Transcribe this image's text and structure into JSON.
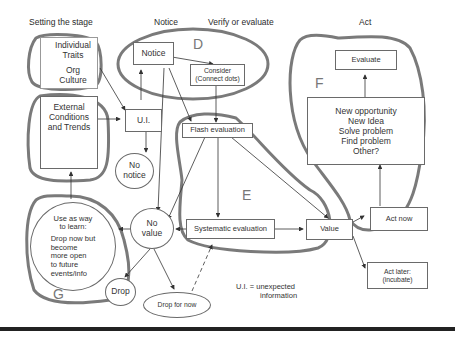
{
  "headers": {
    "setting_stage": "Setting the stage",
    "notice": "Notice",
    "verify": "Verify or evaluate",
    "act": "Act"
  },
  "region_labels": {
    "A": "A",
    "B": "B",
    "C": "C",
    "D": "D",
    "E": "E",
    "F": "F",
    "G": "G"
  },
  "nodes": {
    "individual_traits": "Individual Traits",
    "org_culture": "Org Culture",
    "external_conditions": "External Conditions and Trends",
    "ui": "U.I.",
    "notice": "Notice",
    "consider": "Consider",
    "consider_sub": "(Connect dots)",
    "no_notice_1": "No",
    "no_notice_2": "notice",
    "flash_evaluation": "Flash evaluation",
    "systematic_evaluation": "Systematic evaluation",
    "value": "Value",
    "no_value_1": "No",
    "no_value_2": "value",
    "drop": "Drop",
    "drop_for_now": "Drop for now",
    "evaluate": "Evaluate",
    "outcomes": [
      "New opportunity",
      "New Idea",
      "Solve problem",
      "Find problem",
      "Other?"
    ],
    "act_now": "Act now",
    "act_later_1": "Act later:",
    "act_later_2": "(incubate)",
    "learn_1": "Use as way",
    "learn_2": "to learn:",
    "learn_body": [
      "Drop now but",
      "become",
      "more open",
      "to future",
      "events/info"
    ]
  },
  "legend": {
    "line1": "U.I. = unexpected",
    "line2": "information"
  },
  "colors": {
    "region_outline": "#7a7a7a",
    "box_border": "#6a6a6a",
    "text": "#333333"
  }
}
